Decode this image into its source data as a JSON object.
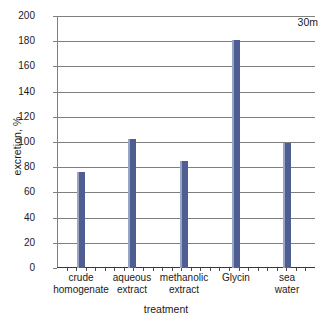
{
  "chart_data": {
    "type": "bar",
    "title": "",
    "xlabel": "treatment",
    "ylabel": "excretion, %",
    "categories": [
      "crude homogenate",
      "aqueous extract",
      "methanolic extract",
      "Glycin",
      "sea water"
    ],
    "category_lines": [
      [
        "crude",
        "homogenate"
      ],
      [
        "aqueous",
        "extract"
      ],
      [
        "methanolic",
        "extract"
      ],
      [
        "Glycin",
        ""
      ],
      [
        "sea",
        "water"
      ]
    ],
    "values": [
      76,
      102,
      85,
      181,
      99
    ],
    "ylim": [
      0,
      200
    ],
    "ytick_step": 20,
    "yticks": [
      "0",
      "20",
      "40",
      "60",
      "80",
      "100",
      "120",
      "140",
      "160",
      "180",
      "200"
    ],
    "grid": true,
    "legend": "none",
    "annotations": [
      {
        "text": "30m",
        "position": "top-right"
      }
    ],
    "series_color": "#4e5d92",
    "gridline_color": "#7f7f7f",
    "axis_color": "#3a3a3a"
  }
}
